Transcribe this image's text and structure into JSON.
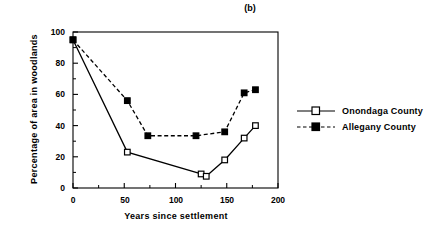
{
  "chart_data": {
    "type": "line",
    "title": "(b)",
    "xlabel": "Years since settlement",
    "ylabel": "Percentage of area in woodlands",
    "xlim": [
      0,
      200
    ],
    "ylim": [
      0,
      100
    ],
    "xticks": [
      0,
      50,
      100,
      150,
      200
    ],
    "xtick_labels": [
      "0",
      "50",
      "100",
      "150",
      "200"
    ],
    "xminor_ticks": [
      25,
      75,
      125,
      175
    ],
    "yticks": [
      0,
      20,
      40,
      60,
      80,
      100
    ],
    "ytick_labels": [
      "0",
      "20",
      "40",
      "60",
      "80",
      "100"
    ],
    "grid": false,
    "legend_position": "right",
    "series": [
      {
        "name": "Onondaga County",
        "marker": "open-square",
        "linestyle": "solid",
        "color": "#000000",
        "x": [
          0,
          53,
          125,
          130,
          148,
          167,
          178
        ],
        "y": [
          95,
          23,
          9,
          7.5,
          18,
          32,
          40
        ]
      },
      {
        "name": "Allegany County",
        "marker": "filled-square",
        "linestyle": "dashed",
        "color": "#000000",
        "x": [
          0,
          53,
          73,
          120,
          148,
          167,
          178
        ],
        "y": [
          95,
          56,
          33.5,
          33.5,
          36,
          61,
          63
        ]
      }
    ]
  },
  "legend": {
    "items": [
      {
        "label": "Onondaga  County"
      },
      {
        "label": "Allegany  County"
      }
    ]
  }
}
